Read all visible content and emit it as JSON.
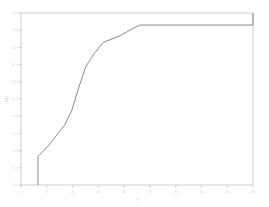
{
  "chart_data": {
    "type": "line",
    "subtype": "step-ecdf",
    "title": "",
    "xlabel": "t",
    "ylabel": "F(t)",
    "xlim": [
      0,
      45
    ],
    "ylim": [
      0,
      1.0
    ],
    "grid": false,
    "legend": null,
    "legend_position": "none",
    "line_color": "#8a8a8a",
    "axis_color": "#b9b9b9",
    "tick_label_color": "#cfcfcf",
    "background_color": "#ffffff",
    "xticks": [
      0,
      5,
      10,
      15,
      20,
      25,
      30,
      35,
      40,
      45
    ],
    "xticklabels": [
      "0",
      "5",
      "10",
      "15",
      "20",
      "25",
      "30",
      "35",
      "40",
      "45"
    ],
    "yticks": [
      0.0,
      0.1,
      0.2,
      0.3,
      0.4,
      0.5,
      0.6,
      0.7,
      0.8,
      0.9,
      1.0
    ],
    "yticklabels": [
      "0.0",
      "0.1",
      "0.2",
      "0.3",
      "0.4",
      "0.5",
      "0.6",
      "0.7",
      "0.8",
      "0.9",
      "1.0"
    ],
    "x": [
      3.3,
      3.3,
      5.2,
      6.8,
      8.4,
      9.8,
      11.4,
      12.6,
      14.2,
      16.0,
      19.0,
      23.0,
      45.0,
      45.0
    ],
    "y": [
      0.0,
      0.165,
      0.225,
      0.285,
      0.345,
      0.43,
      0.585,
      0.69,
      0.765,
      0.83,
      0.865,
      0.93,
      0.93,
      1.0
    ],
    "steps": [
      {
        "x": 3.3,
        "y": 0.165
      },
      {
        "x": 5.2,
        "y": 0.225
      },
      {
        "x": 6.8,
        "y": 0.285
      },
      {
        "x": 8.4,
        "y": 0.345
      },
      {
        "x": 9.8,
        "y": 0.43
      },
      {
        "x": 11.4,
        "y": 0.585
      },
      {
        "x": 12.6,
        "y": 0.69
      },
      {
        "x": 14.2,
        "y": 0.765
      },
      {
        "x": 16.0,
        "y": 0.83
      },
      {
        "x": 19.0,
        "y": 0.865
      },
      {
        "x": 23.0,
        "y": 0.93
      },
      {
        "x": 45.0,
        "y": 1.0
      }
    ]
  }
}
